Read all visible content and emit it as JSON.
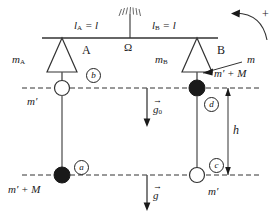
{
  "figure": {
    "type": "physics-schematic",
    "title_visible": false,
    "background": "#ffffff",
    "stroke_color": "#1a1a1a",
    "fill_dark": "#1a1a1a",
    "fill_light": "#ffffff"
  },
  "beam": {
    "left_arm_label": "l",
    "left_arm_sub": "A",
    "left_arm_eq": "= l",
    "right_arm_label": "l",
    "right_arm_sub": "B",
    "right_arm_eq": "= l",
    "pivot_label": "Ω"
  },
  "knife_edges": {
    "a_letter": "A",
    "b_letter": "B",
    "mass_a": "m",
    "mass_a_sub": "A",
    "mass_b": "m",
    "mass_b_sub": "B"
  },
  "masses": {
    "upper_left": "m′",
    "lower_left": "m′ + M",
    "upper_right": "m′ + M",
    "lower_right": "m′",
    "pointer_label": "m"
  },
  "markers": {
    "a": "a",
    "b": "b",
    "c": "c",
    "d": "d"
  },
  "vectors": {
    "g0_label": "g",
    "g0_sub": "0",
    "g_label": "g",
    "arrow_glyph": "→",
    "height_label": "h",
    "rotation_sign": "+"
  }
}
